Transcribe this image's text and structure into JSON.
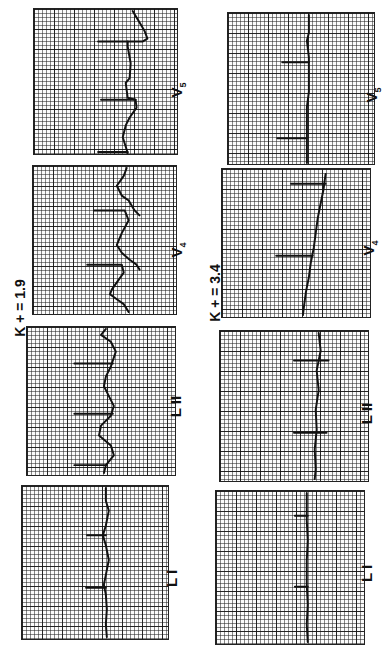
{
  "figure": {
    "orientation": "rotated 90 degrees clockwise",
    "columns": [
      {
        "condition_label": "K + = 1.9",
        "leads": [
          {
            "lead": "V5",
            "label_main": "V",
            "label_sub": "5"
          },
          {
            "lead": "V4",
            "label_main": "V",
            "label_sub": "4"
          },
          {
            "lead": "LII",
            "label_main": "L II",
            "label_sub": ""
          },
          {
            "lead": "LI",
            "label_main": "L I",
            "label_sub": ""
          }
        ]
      },
      {
        "condition_label": "K + = 3.4",
        "leads": [
          {
            "lead": "V5",
            "label_main": "V",
            "label_sub": "5"
          },
          {
            "lead": "V4",
            "label_main": "V",
            "label_sub": "4"
          },
          {
            "lead": "LII",
            "label_main": "L II",
            "label_sub": ""
          },
          {
            "lead": "LI",
            "label_main": "L I",
            "label_sub": ""
          }
        ]
      }
    ],
    "trace_color": "#111111",
    "grid_color": "#222222"
  }
}
